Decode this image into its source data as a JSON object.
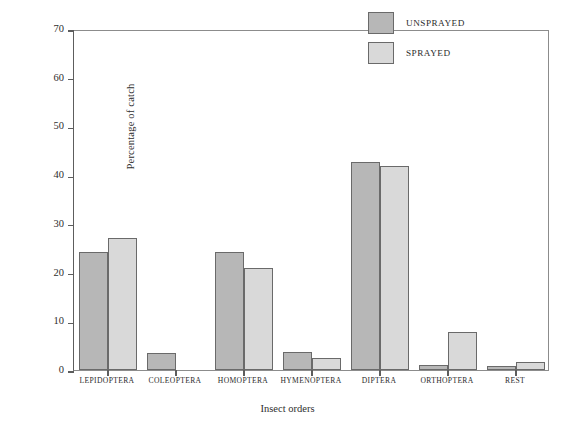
{
  "chart_data": {
    "type": "bar",
    "title": "",
    "xlabel": "Insect orders",
    "ylabel": "Percentage of catch",
    "ylim": [
      0,
      70
    ],
    "yticks": [
      0,
      10,
      20,
      30,
      40,
      50,
      60,
      70
    ],
    "ytick_labels": [
      "0",
      "10",
      "20",
      "30",
      "40",
      "50",
      "60",
      "70"
    ],
    "grid": false,
    "legend_position": "top-right",
    "categories": [
      "LEPIDOPTERA",
      "COLEOPTERA",
      "HOMOPTERA",
      "HYMENOPTERA",
      "DIPTERA",
      "ORTHOPTERA",
      "REST"
    ],
    "series": [
      {
        "name": "UNSPRAYED",
        "color": "#b7b7b7",
        "values": [
          24.3,
          3.4,
          24.2,
          3.6,
          42.7,
          1.0,
          0.8
        ]
      },
      {
        "name": "SPRAYED",
        "color": "#d9d9d9",
        "values": [
          27.2,
          0.0,
          21.0,
          2.4,
          41.8,
          7.9,
          1.6
        ]
      }
    ]
  },
  "legend": {
    "entries": [
      {
        "label": "UNSPRAYED",
        "swatch": "unsprayed"
      },
      {
        "label": "SPRAYED",
        "swatch": "sprayed"
      }
    ]
  }
}
